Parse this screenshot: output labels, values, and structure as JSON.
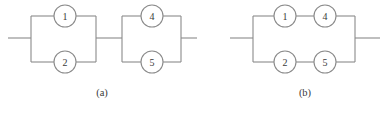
{
  "figure": {
    "background_color": "#ffffff",
    "line_color": "#8a8a8a",
    "text_color": "#3a3a3a",
    "width": 389,
    "height": 113
  },
  "diagrams": [
    {
      "id": "diagram-a",
      "caption": "(a)",
      "caption_x": 102,
      "caption_y": 92,
      "lead_y": 38,
      "top_y": 16,
      "bottom_y": 62,
      "left_lead": {
        "x1": 8,
        "x2": 31
      },
      "middle_lead": {
        "x1": 96,
        "x2": 122
      },
      "right_lead": {
        "x1": 181,
        "x2": 197
      },
      "blocks": [
        {
          "id": "block-a-1",
          "left_x": 31,
          "right_x": 96,
          "nodes": [
            {
              "label": "1",
              "cx": 65,
              "cy": 16,
              "r": 11
            },
            {
              "label": "2",
              "cx": 65,
              "cy": 62,
              "r": 11
            }
          ]
        },
        {
          "id": "block-a-2",
          "left_x": 122,
          "right_x": 181,
          "nodes": [
            {
              "label": "4",
              "cx": 152,
              "cy": 16,
              "r": 11
            },
            {
              "label": "5",
              "cx": 152,
              "cy": 62,
              "r": 11
            }
          ]
        }
      ]
    },
    {
      "id": "diagram-b",
      "caption": "(b)",
      "caption_x": 305,
      "caption_y": 92,
      "lead_y": 38,
      "top_y": 16,
      "bottom_y": 62,
      "left_lead": {
        "x1": 230,
        "x2": 253
      },
      "right_lead": {
        "x1": 355,
        "x2": 380
      },
      "blocks": [
        {
          "id": "block-b-1",
          "left_x": 253,
          "right_x": 355,
          "nodes": [
            {
              "label": "1",
              "cx": 285,
              "cy": 16,
              "r": 11
            },
            {
              "label": "4",
              "cx": 325,
              "cy": 16,
              "r": 11
            },
            {
              "label": "2",
              "cx": 285,
              "cy": 62,
              "r": 11
            },
            {
              "label": "5",
              "cx": 325,
              "cy": 62,
              "r": 11
            }
          ]
        }
      ]
    }
  ]
}
